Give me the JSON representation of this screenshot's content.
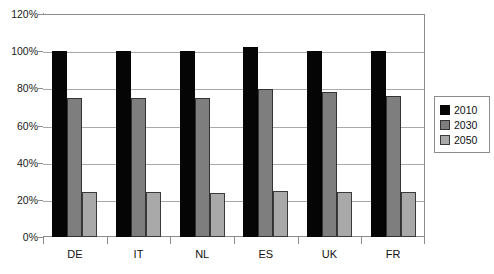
{
  "chart_data": {
    "type": "bar",
    "title": "",
    "subtitle": "",
    "xlabel": "",
    "ylabel": "",
    "categories": [
      "DE",
      "IT",
      "NL",
      "ES",
      "UK",
      "FR"
    ],
    "series": [
      {
        "name": "2010",
        "color": "#050505",
        "values": [
          100,
          100,
          100,
          102,
          100,
          100
        ]
      },
      {
        "name": "2030",
        "color": "#7e7e7e",
        "values": [
          75,
          75,
          75,
          79.5,
          78,
          76
        ]
      },
      {
        "name": "2050",
        "color": "#a9a9a9",
        "values": [
          24,
          24,
          23.5,
          25,
          24,
          24
        ]
      }
    ],
    "ylim": [
      0,
      120
    ],
    "ytick_values": [
      0,
      20,
      40,
      60,
      80,
      100,
      120
    ],
    "ytick_labels": [
      "0%",
      "20%",
      "40%",
      "60%",
      "80%",
      "100%",
      "120%"
    ],
    "grid": true,
    "grid_axis": "y",
    "legend": [
      "2010",
      "2030",
      "2050"
    ],
    "legend_position": "right",
    "value_format": "percent",
    "annotations": []
  },
  "colors": {
    "series_2010": "#050505",
    "series_2030": "#7e7e7e",
    "series_2050": "#a9a9a9",
    "gridline": "#a9a9a9",
    "axis": "#8c8c8c",
    "background": "#ffffff",
    "text": "#111111"
  }
}
